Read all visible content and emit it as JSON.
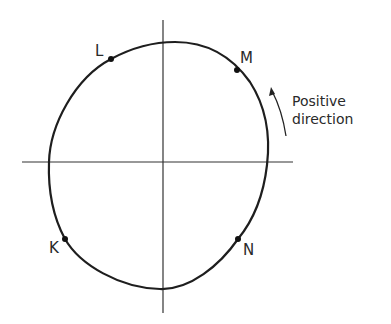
{
  "diagram": {
    "type": "closed-curve-with-axes",
    "colors": {
      "stroke": "#1e1e1e",
      "background": "#ffffff",
      "axis": "#333333"
    },
    "points": [
      {
        "id": "L",
        "label": "L"
      },
      {
        "id": "M",
        "label": "M"
      },
      {
        "id": "N",
        "label": "N"
      },
      {
        "id": "K",
        "label": "K"
      }
    ],
    "annotation": {
      "line1": "Positive",
      "line2": "direction",
      "arrow": "counter-clockwise"
    }
  }
}
